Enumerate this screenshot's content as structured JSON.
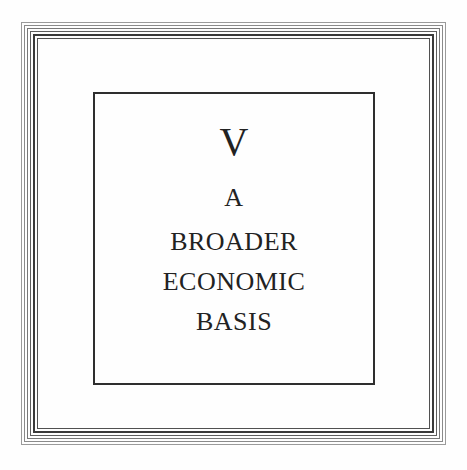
{
  "chapter": {
    "number": "V",
    "title_lines": [
      "A",
      "BROADER",
      "ECONOMIC",
      "BASIS"
    ]
  },
  "colors": {
    "text": "#222222",
    "frame": "#2e2e2e",
    "background": "#ffffff"
  }
}
